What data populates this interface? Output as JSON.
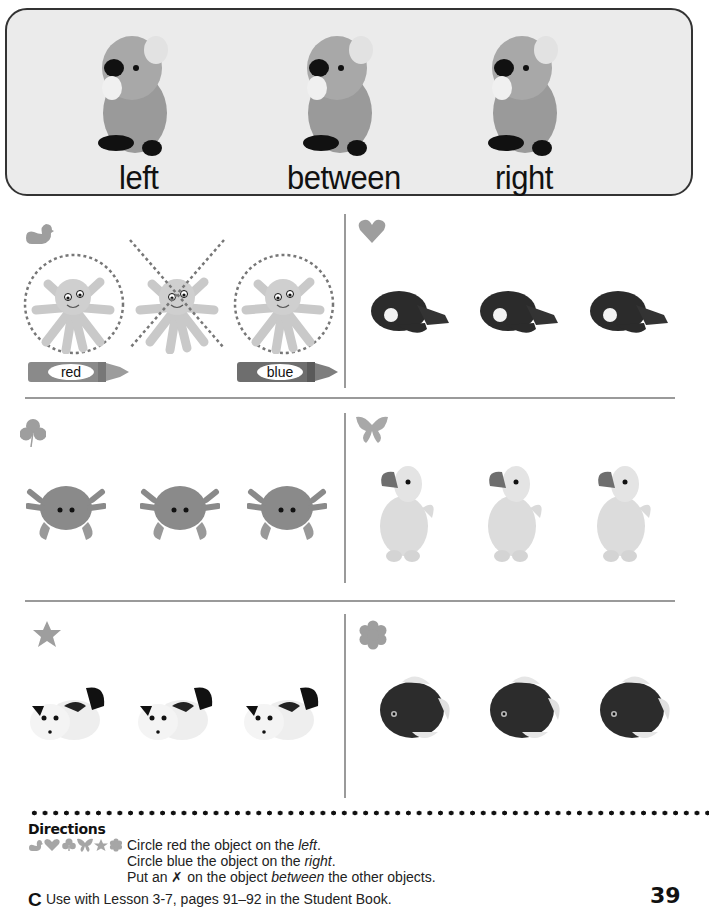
{
  "banner": {
    "labels": {
      "left": "left",
      "between": "between",
      "right": "right"
    },
    "object": "koala-plush"
  },
  "exercises": [
    {
      "symbol": "duck-icon",
      "object": "octopus-plush",
      "count": 3,
      "example": true,
      "crayons": {
        "left": "red",
        "right": "blue"
      }
    },
    {
      "symbol": "heart-icon",
      "object": "whale-plush",
      "count": 3
    },
    {
      "symbol": "club-icon",
      "object": "crab-plush",
      "count": 3
    },
    {
      "symbol": "butterfly-icon",
      "object": "duck-plush",
      "count": 3
    },
    {
      "symbol": "star-icon",
      "object": "cow-plush",
      "count": 3
    },
    {
      "symbol": "flower-icon",
      "object": "fish-plush",
      "count": 3
    }
  ],
  "directions": {
    "title": "Directions",
    "line1_pre": "Circle red the object on the ",
    "line1_em": "left",
    "line1_post": ".",
    "line2_pre": "Circle blue the object on the ",
    "line2_em": "right",
    "line2_post": ".",
    "line3_pre": "Put an ",
    "line3_x": "✗",
    "line3_mid": " on the object ",
    "line3_em": "between",
    "line3_post": " the other objects."
  },
  "footer": {
    "logo": "C",
    "text": "Use with Lesson 3-7, pages 91–92 in the Student Book.",
    "page_number": "39"
  },
  "colors": {
    "symbol_gray": "#9e9e9e",
    "line_gray": "#9a9a9a",
    "banner_bg": "#ebebeb"
  }
}
